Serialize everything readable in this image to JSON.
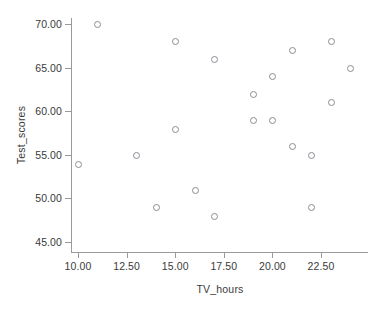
{
  "chart_data": {
    "type": "scatter",
    "title": "",
    "xlabel": "TV_hours",
    "ylabel": "Test_scores",
    "xlim": [
      8.8,
      24.9
    ],
    "ylim": [
      43.6,
      71.2
    ],
    "grid": false,
    "legend": null,
    "xticks": [
      "10.00",
      "12.50",
      "15.00",
      "17.50",
      "20.00",
      "22.50"
    ],
    "xtick_values": [
      10.0,
      12.5,
      15.0,
      17.5,
      20.0,
      22.5
    ],
    "yticks": [
      "45.00",
      "50.00",
      "55.00",
      "60.00",
      "65.00",
      "70.00"
    ],
    "ytick_values": [
      45.0,
      50.0,
      55.0,
      60.0,
      65.0,
      70.0
    ],
    "marker": "open-circle",
    "marker_color": "#8b8b94",
    "axis_color": "#9a9a9a",
    "text_color": "#3a3a3a",
    "background": "#ffffff",
    "n_points": 21,
    "points": [
      {
        "x": 10,
        "y": 54
      },
      {
        "x": 11,
        "y": 70
      },
      {
        "x": 13,
        "y": 55
      },
      {
        "x": 14,
        "y": 49
      },
      {
        "x": 15,
        "y": 68
      },
      {
        "x": 15,
        "y": 58
      },
      {
        "x": 16,
        "y": 51
      },
      {
        "x": 17,
        "y": 66
      },
      {
        "x": 17,
        "y": 48
      },
      {
        "x": 19,
        "y": 62
      },
      {
        "x": 19,
        "y": 59
      },
      {
        "x": 20,
        "y": 64
      },
      {
        "x": 20,
        "y": 59
      },
      {
        "x": 21,
        "y": 67
      },
      {
        "x": 21,
        "y": 56
      },
      {
        "x": 22,
        "y": 55
      },
      {
        "x": 22,
        "y": 49
      },
      {
        "x": 23,
        "y": 68
      },
      {
        "x": 23,
        "y": 61
      },
      {
        "x": 24,
        "y": 65
      }
    ]
  }
}
